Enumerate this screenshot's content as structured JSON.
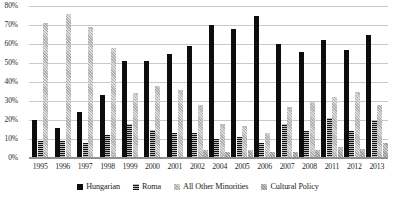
{
  "chart_data": {
    "type": "bar",
    "title": "",
    "subtitle": "",
    "xlabel": "",
    "ylabel": "",
    "ylim": [
      0,
      80
    ],
    "ytick_labels": [
      "0%",
      "10%",
      "20%",
      "30%",
      "40%",
      "50%",
      "60%",
      "70%",
      "80%"
    ],
    "ytick_values": [
      0,
      10,
      20,
      30,
      40,
      50,
      60,
      70,
      80
    ],
    "grid": true,
    "legend_position": "bottom",
    "categories": [
      "1995",
      "1996",
      "1997",
      "1998",
      "1999",
      "2000",
      "2001",
      "2002",
      "2004",
      "2005",
      "2006",
      "2007",
      "2008",
      "2011",
      "2012",
      "2013"
    ],
    "series": [
      {
        "name": "Hungarian",
        "color": "#0d0d0d",
        "values": [
          20,
          16,
          24,
          33,
          51,
          51,
          55,
          59,
          70,
          68,
          75,
          60,
          56,
          62,
          57,
          65
        ]
      },
      {
        "name": "Roma",
        "color": "#2e2e2e",
        "values": [
          9,
          9,
          8,
          12,
          18,
          15,
          13,
          13,
          10,
          11,
          8,
          18,
          14,
          21,
          14,
          20
        ]
      },
      {
        "name": "All Other Minorities",
        "color": "#c4c4c4",
        "values": [
          71,
          76,
          69,
          58,
          34,
          38,
          36,
          28,
          18,
          17,
          13,
          27,
          30,
          32,
          35,
          28
        ]
      },
      {
        "name": "Cultural Policy",
        "color": "#a8a8a8",
        "values": [
          null,
          null,
          null,
          null,
          null,
          null,
          null,
          4,
          3,
          4,
          3,
          3,
          4,
          6,
          5,
          8
        ]
      }
    ]
  },
  "legend": {
    "items": [
      {
        "label": "Hungarian"
      },
      {
        "label": "Roma"
      },
      {
        "label": "All Other Minorities"
      },
      {
        "label": "Cultural Policy"
      }
    ]
  }
}
